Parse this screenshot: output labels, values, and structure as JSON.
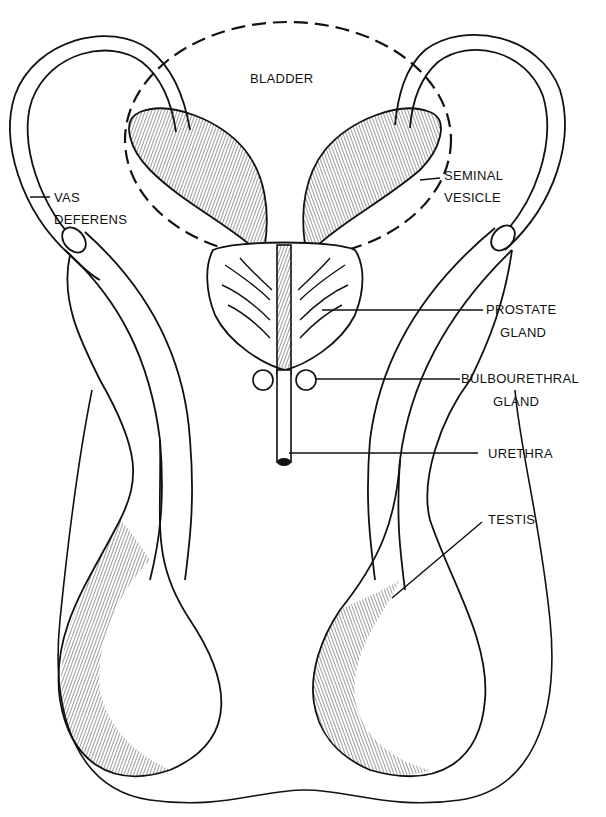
{
  "diagram": {
    "type": "anatomical line drawing",
    "colors": {
      "ink": "#111111",
      "background": "#ffffff"
    }
  },
  "labels": {
    "bladder": {
      "line1": "BLADDER"
    },
    "seminal_vesicle": {
      "line1": "SEMINAL",
      "line2": "VESICLE"
    },
    "vas_deferens": {
      "line1": "VAS",
      "line2": "DEFERENS"
    },
    "prostate_gland": {
      "line1": "PROSTATE",
      "line2": "GLAND"
    },
    "bulbourethral_gland": {
      "line1": "BULBOURETHRAL",
      "line2": "GLAND"
    },
    "urethra": {
      "line1": "URETHRA"
    },
    "testis": {
      "line1": "TESTIS"
    }
  }
}
